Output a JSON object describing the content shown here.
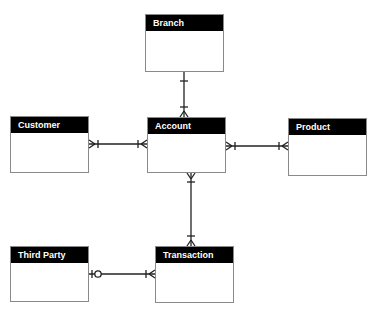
{
  "diagram": {
    "type": "entity-relationship",
    "entities": [
      {
        "id": "branch",
        "name": "Branch",
        "x": 145,
        "y": 14,
        "w": 79,
        "h": 58
      },
      {
        "id": "account",
        "name": "Account",
        "x": 147,
        "y": 117,
        "w": 79,
        "h": 56
      },
      {
        "id": "customer",
        "name": "Customer",
        "x": 10,
        "y": 116,
        "w": 79,
        "h": 57
      },
      {
        "id": "product",
        "name": "Product",
        "x": 288,
        "y": 118,
        "w": 79,
        "h": 58
      },
      {
        "id": "third_party",
        "name": "Third Party",
        "x": 10,
        "y": 246,
        "w": 79,
        "h": 56
      },
      {
        "id": "transaction",
        "name": "Transaction",
        "x": 155,
        "y": 246,
        "w": 79,
        "h": 57
      }
    ],
    "relationships": [
      {
        "from": "Branch",
        "from_end": "one-and-only-one",
        "to": "Account",
        "to_end": "one-or-many"
      },
      {
        "from": "Customer",
        "from_end": "one-or-many",
        "to": "Account",
        "to_end": "one-or-many"
      },
      {
        "from": "Account",
        "from_end": "one-or-many",
        "to": "Product",
        "to_end": "one-or-many"
      },
      {
        "from": "Account",
        "from_end": "one-or-many",
        "to": "Transaction",
        "to_end": "one-or-many"
      },
      {
        "from": "Third Party",
        "from_end": "zero-or-one",
        "to": "Transaction",
        "to_end": "one-or-many"
      }
    ],
    "colors": {
      "header_bg": "#000000",
      "header_text": "#ffffff",
      "border": "#8a8a8a",
      "line": "#222222"
    }
  }
}
